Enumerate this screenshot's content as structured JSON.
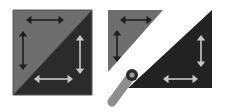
{
  "figure": {
    "background_color": "#ffffff",
    "width": 226,
    "height": 112,
    "panels": [
      {
        "id": "panel-left",
        "name": "joined-square",
        "description": "Square composed of two right triangles joined along the anti-diagonal",
        "x": 13,
        "y": 10,
        "width": 79,
        "height": 85,
        "outline_color": "#555555",
        "shapes": [
          {
            "name": "upper-left-triangle",
            "fill": "#6e6e6e",
            "points": "13,10 92,10 13,95"
          },
          {
            "name": "lower-right-triangle",
            "fill": "#2b2b2b",
            "points": "92,10 92,95 13,95"
          }
        ],
        "arrows": [
          {
            "name": "top-horizontal-arrow",
            "orientation": "horizontal",
            "color": "#1f1f1f",
            "x1": 26,
            "y1": 20,
            "x2": 64,
            "y2": 20
          },
          {
            "name": "left-vertical-arrow",
            "orientation": "vertical",
            "color": "#1f1f1f",
            "x1": 23,
            "y1": 31,
            "x2": 23,
            "y2": 70
          },
          {
            "name": "right-vertical-arrow",
            "orientation": "vertical",
            "color": "#c8c8c8",
            "x1": 80,
            "y1": 35,
            "x2": 80,
            "y2": 74
          },
          {
            "name": "bottom-horizontal-arrow",
            "orientation": "horizontal",
            "color": "#c8c8c8",
            "x1": 34,
            "y1": 79,
            "x2": 73,
            "y2": 79
          }
        ]
      },
      {
        "id": "panel-right",
        "name": "separated-triangles",
        "description": "Same square pulled apart along the diagonal with a rotation pivot tool",
        "x": 108,
        "y": 10,
        "width": 104,
        "height": 99,
        "shapes": [
          {
            "name": "upper-left-triangle-detached",
            "fill": "#6e6e6e",
            "points": "108,10 163,10 108,72"
          },
          {
            "name": "lower-right-triangle-detached",
            "fill": "#222222",
            "points": "212,10 212,88 128,88"
          }
        ],
        "arrows": [
          {
            "name": "top-horizontal-arrow",
            "orientation": "horizontal",
            "color": "#1f1f1f",
            "x1": 120,
            "y1": 20,
            "x2": 152,
            "y2": 20
          },
          {
            "name": "left-vertical-arrow",
            "orientation": "vertical",
            "color": "#1f1f1f",
            "x1": 117,
            "y1": 30,
            "x2": 117,
            "y2": 62
          },
          {
            "name": "right-vertical-arrow",
            "orientation": "vertical",
            "color": "#c8c8c8",
            "x1": 201,
            "y1": 35,
            "x2": 201,
            "y2": 67
          },
          {
            "name": "bottom-horizontal-arrow",
            "orientation": "horizontal",
            "color": "#c8c8c8",
            "x1": 163,
            "y1": 79,
            "x2": 198,
            "y2": 79
          }
        ],
        "tool": {
          "name": "pivot-handle-tool",
          "icon": "pivot-pin-icon",
          "body_color": "#8d8d8d",
          "ring_outer_color": "#2b2b2b",
          "ring_inner_color": "#9a9a9a",
          "shaft_from_x": 112,
          "shaft_from_y": 102,
          "shaft_to_x": 131,
          "shaft_to_y": 76,
          "shaft_width": 9,
          "ring_cx": 132,
          "ring_cy": 75,
          "ring_r_outer": 6,
          "ring_r_inner": 2.6
        }
      }
    ],
    "colors": {
      "light_triangle": "#6e6e6e",
      "dark_triangle": "#2b2b2b",
      "dark_arrow": "#1f1f1f",
      "light_arrow": "#c8c8c8",
      "tool_body": "#8d8d8d",
      "background": "#ffffff"
    }
  }
}
